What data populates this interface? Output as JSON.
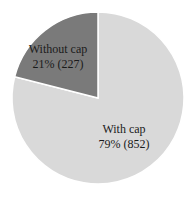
{
  "chart_data": {
    "type": "pie",
    "title": "",
    "categories": [
      "With cap",
      "Without cap"
    ],
    "values": [
      852,
      227
    ],
    "percentages": [
      79,
      21
    ],
    "colors": [
      "#d9d9d9",
      "#7a7a7a"
    ],
    "labels": [
      {
        "name": "With cap",
        "text": "79% (852)"
      },
      {
        "name": "Without cap",
        "text": "21% (227)"
      }
    ],
    "start_angle": "12 o'clock",
    "legend": "none (inline labels)"
  }
}
